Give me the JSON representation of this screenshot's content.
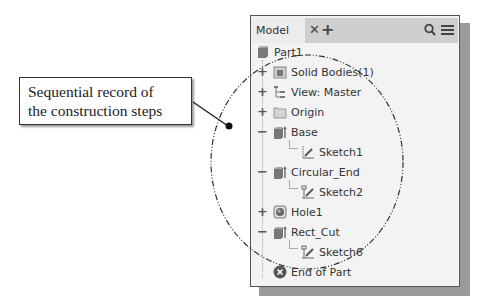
{
  "callout": {
    "line1": "Sequential record of",
    "line2": "the construction steps"
  },
  "panel": {
    "tab_label": "Model",
    "close_icon": "close-icon",
    "add_icon": "plus-icon",
    "search_icon": "search-icon",
    "menu_icon": "hamburger-menu-icon"
  },
  "tree": {
    "part": "Part1",
    "items": [
      {
        "label": "Solid Bodies(1)",
        "expander": "+",
        "icon": "solid-bodies-icon"
      },
      {
        "label": "View: Master",
        "expander": "+",
        "icon": "view-rep-icon"
      },
      {
        "label": "Origin",
        "expander": "+",
        "icon": "folder-icon"
      },
      {
        "label": "Base",
        "expander": "−",
        "icon": "extrusion-icon"
      },
      {
        "label": "Sketch1",
        "expander": "",
        "icon": "sketch-icon"
      },
      {
        "label": "Circular_End",
        "expander": "−",
        "icon": "extrusion-icon"
      },
      {
        "label": "Sketch2",
        "expander": "",
        "icon": "sketch-icon"
      },
      {
        "label": "Hole1",
        "expander": "+",
        "icon": "hole-icon"
      },
      {
        "label": "Rect_Cut",
        "expander": "−",
        "icon": "extrusion-icon"
      },
      {
        "label": "Sketch6",
        "expander": "",
        "icon": "sketch-icon"
      },
      {
        "label": "End of Part",
        "expander": "",
        "icon": "end-of-part-icon"
      }
    ]
  }
}
